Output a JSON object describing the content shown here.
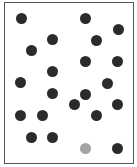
{
  "board": {
    "border_color": "#555555",
    "background": "#ffffff"
  },
  "colors": {
    "dark": "#2b2b2b",
    "highlight": "#a3a3a3"
  },
  "dots": [
    {
      "x": 21,
      "y": 18,
      "color": "dark"
    },
    {
      "x": 85,
      "y": 18,
      "color": "dark"
    },
    {
      "x": 118,
      "y": 29,
      "color": "dark"
    },
    {
      "x": 52,
      "y": 39,
      "color": "dark"
    },
    {
      "x": 96,
      "y": 40,
      "color": "dark"
    },
    {
      "x": 31,
      "y": 50,
      "color": "dark"
    },
    {
      "x": 85,
      "y": 61,
      "color": "dark"
    },
    {
      "x": 117,
      "y": 61,
      "color": "dark"
    },
    {
      "x": 52,
      "y": 71,
      "color": "dark"
    },
    {
      "x": 20,
      "y": 82,
      "color": "dark"
    },
    {
      "x": 107,
      "y": 83,
      "color": "dark"
    },
    {
      "x": 52,
      "y": 93,
      "color": "dark"
    },
    {
      "x": 85,
      "y": 94,
      "color": "dark"
    },
    {
      "x": 74,
      "y": 104,
      "color": "dark"
    },
    {
      "x": 117,
      "y": 104,
      "color": "dark"
    },
    {
      "x": 20,
      "y": 115,
      "color": "dark"
    },
    {
      "x": 42,
      "y": 115,
      "color": "dark"
    },
    {
      "x": 96,
      "y": 115,
      "color": "dark"
    },
    {
      "x": 31,
      "y": 137,
      "color": "dark"
    },
    {
      "x": 52,
      "y": 137,
      "color": "dark"
    },
    {
      "x": 85,
      "y": 148,
      "color": "highlight"
    },
    {
      "x": 117,
      "y": 148,
      "color": "dark"
    }
  ]
}
